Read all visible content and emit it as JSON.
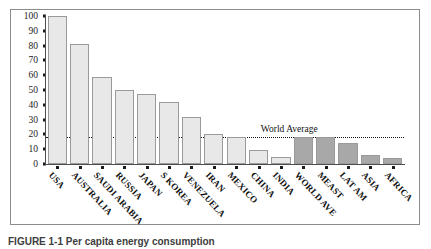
{
  "chart_data": {
    "type": "bar",
    "title": "",
    "xlabel": "",
    "ylabel": "USA = 100",
    "ylim": [
      0,
      100
    ],
    "yticks": [
      0,
      10,
      20,
      30,
      40,
      50,
      60,
      70,
      80,
      90,
      100
    ],
    "grid": false,
    "legend_position": "none",
    "categories": [
      "USA",
      "AUSTRALIA",
      "SAUDI ARABIA",
      "RUSSIA",
      "JAPAN",
      "S KOREA",
      "VENEZUELA",
      "IRAN",
      "MEXICO",
      "CHINA",
      "INDIA",
      "WORLD AVE",
      "MEAST",
      "LAT AM",
      "ASIA",
      "AFRICA"
    ],
    "values": [
      100,
      81,
      59,
      50,
      47,
      42,
      32,
      20,
      18,
      9.5,
      5,
      18.5,
      18.5,
      14,
      6,
      4
    ],
    "series": [
      {
        "name": "Energy use index",
        "values": [
          100,
          81,
          59,
          50,
          47,
          42,
          32,
          20,
          18,
          9.5,
          5,
          18.5,
          18.5,
          14,
          6,
          4
        ]
      }
    ],
    "bar_groups": [
      {
        "name": "countries",
        "from": 0,
        "to": 10,
        "color": "#e8e8e8"
      },
      {
        "name": "aggregates",
        "from": 11,
        "to": 15,
        "color": "#a8a8a8"
      }
    ],
    "annotations": [
      {
        "name": "world-average-line",
        "label": "World Average",
        "value": 18.5,
        "style": "dotted-horizontal"
      }
    ],
    "colors": {
      "country_bar": "#e8e8e8",
      "aggregate_bar": "#a8a8a8",
      "bar_edge": "#9a9a9a",
      "axis": "#4d4d4d",
      "text": "#111111"
    }
  },
  "caption": {
    "text": "FIGURE 1-1  Per capita energy consumption"
  }
}
